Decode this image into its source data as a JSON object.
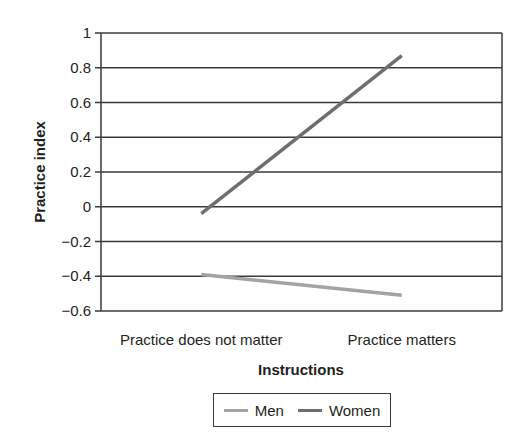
{
  "chart_data": {
    "type": "line",
    "title": "",
    "xlabel": "Instructions",
    "ylabel": "Practice index",
    "categories": [
      "Practice does not matter",
      "Practice matters"
    ],
    "series": [
      {
        "name": "Men",
        "values": [
          -0.39,
          -0.51
        ],
        "color": "#a3a3a3"
      },
      {
        "name": "Women",
        "values": [
          -0.04,
          0.87
        ],
        "color": "#6e6e6e"
      }
    ],
    "ylim": [
      -0.6,
      1
    ],
    "yticks": [
      1,
      0.8,
      0.6,
      0.4,
      0.2,
      0,
      -0.2,
      -0.4,
      -0.6
    ],
    "ytick_labels": [
      "1",
      "0.8",
      "0.6",
      "0.4",
      "0.2",
      "0",
      "−0.2",
      "−0.4",
      "−0.6"
    ],
    "grid": true,
    "legend_position": "bottom"
  },
  "legend": {
    "items": [
      {
        "label": "Men",
        "color": "#a3a3a3"
      },
      {
        "label": "Women",
        "color": "#6e6e6e"
      }
    ]
  },
  "colors": {
    "gridline": "#3a3a3a",
    "axis": "#3a3a3a",
    "text": "#231f20"
  }
}
